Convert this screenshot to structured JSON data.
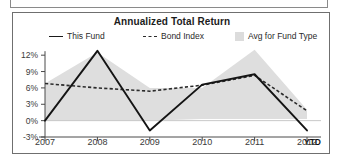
{
  "chart_data": {
    "type": "line",
    "title": "Annualized Total Return",
    "xlabel": "",
    "ylabel": "",
    "categories": [
      "2007",
      "2008",
      "2009",
      "2010",
      "2011",
      "2012"
    ],
    "x_axis_note": "YTD",
    "ytick_labels": [
      "12%",
      "9%",
      "6%",
      "3%",
      "0%",
      "-3%"
    ],
    "ytick_values": [
      12,
      9,
      6,
      3,
      0,
      -3
    ],
    "ylim": [
      -3,
      13.5
    ],
    "grid": false,
    "legend_position": "top",
    "series": [
      {
        "name": "This Fund",
        "style": "solid",
        "color": "#1a1a1a",
        "values": [
          0.0,
          12.8,
          -1.8,
          6.6,
          8.5,
          -1.8
        ]
      },
      {
        "name": "Bond Index",
        "style": "dashed",
        "color": "#2b2b2b",
        "values": [
          6.8,
          6.0,
          5.4,
          6.5,
          8.3,
          1.8
        ]
      },
      {
        "name": "Avg for Fund Type",
        "style": "band",
        "color": "#dcdcdc",
        "upper": [
          6.8,
          12.5,
          6.0,
          6.0,
          13.0,
          2.0
        ],
        "lower": [
          0.0,
          0.0,
          0.0,
          0.3,
          0.3,
          0.3
        ]
      }
    ]
  },
  "legend": {
    "items": [
      {
        "label": "This Fund",
        "marker": "solid-line-icon"
      },
      {
        "label": "Bond Index",
        "marker": "dashed-line-icon"
      },
      {
        "label": "Avg for Fund Type",
        "marker": "area-swatch-icon"
      }
    ]
  }
}
